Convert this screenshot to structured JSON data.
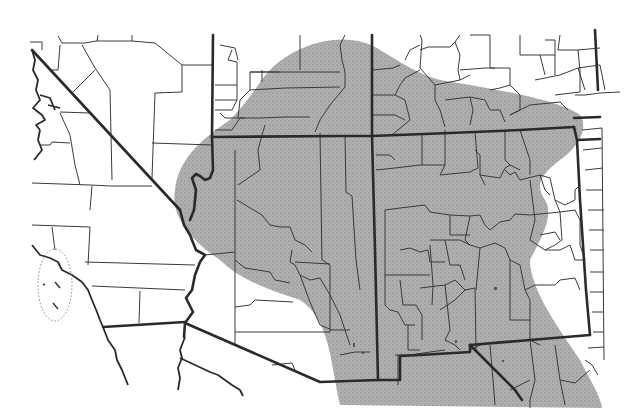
{
  "map": {
    "type": "species-range-map",
    "region": "Southwestern United States and northern Mexico",
    "style": "scanned county outline map with stippled range shading",
    "colors": {
      "background": "#ffffff",
      "range_fill": "#a9a9a9",
      "range_stipple": "#8c8c8c",
      "county_lines": "#3a3a3a",
      "state_lines": "#2a2a2a"
    },
    "legend": null,
    "labels": []
  },
  "layers": [
    {
      "id": "range",
      "label": "Shaded distribution range"
    },
    {
      "id": "state-boundaries",
      "label": "State / international boundaries"
    },
    {
      "id": "county-boundaries",
      "label": "County boundaries"
    },
    {
      "id": "channel-islands",
      "label": "Offshore islands (dotted enclosure)"
    }
  ]
}
